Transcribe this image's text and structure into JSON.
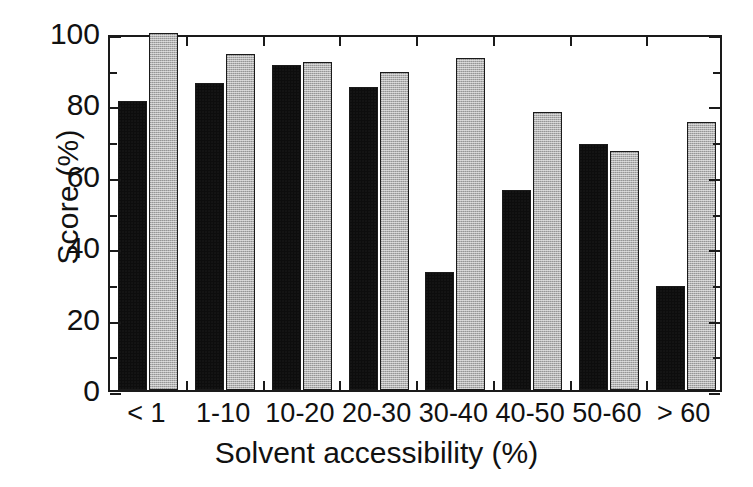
{
  "chart_data": {
    "type": "bar",
    "title": "",
    "xlabel": "Solvent accessibility (%)",
    "ylabel": "Score (%)",
    "ylim": [
      0,
      100
    ],
    "yticks": [
      0,
      20,
      40,
      60,
      80,
      100
    ],
    "yminorticks": [
      10,
      30,
      50,
      70,
      90
    ],
    "grid": false,
    "legend": "none",
    "categories": [
      "< 1",
      "1-10",
      "10-20",
      "20-30",
      "30-40",
      "40-50",
      "50-60",
      "> 60"
    ],
    "series": [
      {
        "name": "black",
        "color": "#0d0d0d",
        "values": [
          81,
          86,
          91,
          85,
          33,
          56,
          69,
          29
        ]
      },
      {
        "name": "gray",
        "color": "#b2b2b2",
        "values": [
          100,
          94,
          92,
          89,
          93,
          78,
          67,
          75
        ]
      }
    ]
  },
  "axes": {
    "y_tick_labels": [
      "0",
      "20",
      "40",
      "60",
      "80",
      "100"
    ],
    "x_tick_labels": [
      "< 1",
      "1-10",
      "10-20",
      "20-30",
      "30-40",
      "40-50",
      "50-60",
      "> 60"
    ],
    "x_axis_title": "Solvent accessibility (%)",
    "y_axis_title": "Score (%)"
  },
  "colors": {
    "axis": "#1a1a1a",
    "background": "#ffffff",
    "series_dark": "#0d0d0d",
    "series_light": "#b2b2b2"
  }
}
